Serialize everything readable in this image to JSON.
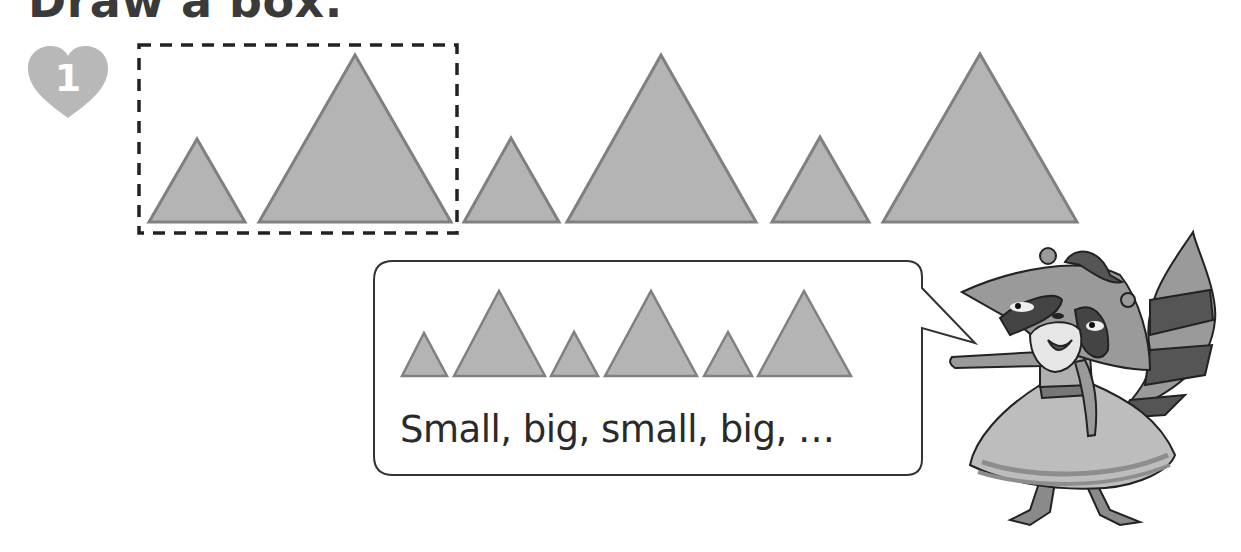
{
  "page": {
    "title": "Draw a box.",
    "exercise_number": "1"
  },
  "colors": {
    "triangle_fill": "#b4b4b4",
    "triangle_stroke": "#808080",
    "heart": "#b8b8b8",
    "dashed_box": "#222222",
    "text": "#2a2a2a"
  },
  "pattern_row": {
    "triangles": [
      {
        "size": "small",
        "x1": 149,
        "x2": 245,
        "apex_y": 139,
        "base_y": 222
      },
      {
        "size": "big",
        "x1": 259,
        "x2": 451,
        "apex_y": 55,
        "base_y": 222
      },
      {
        "size": "small",
        "x1": 464,
        "x2": 559,
        "apex_y": 138,
        "base_y": 222
      },
      {
        "size": "big",
        "x1": 567,
        "x2": 756,
        "apex_y": 55,
        "base_y": 222
      },
      {
        "size": "small",
        "x1": 772,
        "x2": 869,
        "apex_y": 137,
        "base_y": 222
      },
      {
        "size": "big",
        "x1": 883,
        "x2": 1077,
        "apex_y": 54,
        "base_y": 222
      }
    ],
    "answer_box": {
      "x": 139,
      "y": 45,
      "width": 318,
      "height": 188,
      "label": "dashed box around first small-big pair"
    }
  },
  "speech_bubble": {
    "text": "Small, big, small, big, …",
    "example_triangles": [
      {
        "size": "small",
        "x1": 402,
        "x2": 447,
        "apex_y": 333,
        "base_y": 376
      },
      {
        "size": "big",
        "x1": 454,
        "x2": 545,
        "apex_y": 291,
        "base_y": 376
      },
      {
        "size": "small",
        "x1": 551,
        "x2": 598,
        "apex_y": 332,
        "base_y": 376
      },
      {
        "size": "big",
        "x1": 605,
        "x2": 697,
        "apex_y": 291,
        "base_y": 376
      },
      {
        "size": "small",
        "x1": 704,
        "x2": 752,
        "apex_y": 332,
        "base_y": 376
      },
      {
        "size": "big",
        "x1": 758,
        "x2": 851,
        "apex_y": 291,
        "base_y": 376
      }
    ]
  },
  "character": {
    "name": "raccoon",
    "description": "Raccoon in a dress pointing at the speech bubble"
  }
}
